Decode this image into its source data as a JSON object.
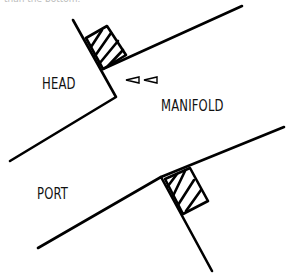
{
  "caption": "than the bottom.",
  "labels": {
    "head": "HEAD",
    "manifold": "MANIFOLD",
    "port": "PORT"
  },
  "colors": {
    "stroke": "#000000",
    "text": "#111111",
    "caption": "#bbbbbb",
    "background": "#ffffff"
  },
  "icons": {
    "flow_arrows": "left-pointing-arrow-pair"
  }
}
